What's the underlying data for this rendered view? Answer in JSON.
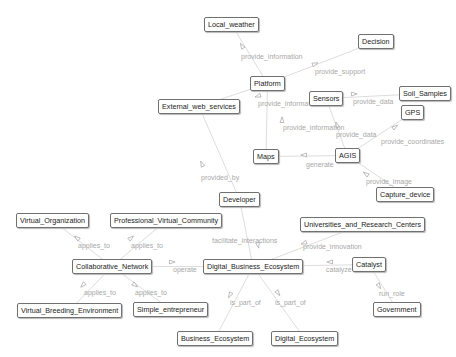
{
  "diagram": {
    "nodes": [
      {
        "id": "local_weather",
        "label": "Local_weather",
        "x": 204,
        "y": 17
      },
      {
        "id": "decision",
        "label": "Decision",
        "x": 358,
        "y": 34
      },
      {
        "id": "platform",
        "label": "Platform",
        "x": 250,
        "y": 76
      },
      {
        "id": "external_web_services",
        "label": "External_web_services",
        "x": 158,
        "y": 99
      },
      {
        "id": "sensors",
        "label": "Sensors",
        "x": 309,
        "y": 91
      },
      {
        "id": "soil_samples",
        "label": "Soil_Samples",
        "x": 399,
        "y": 86
      },
      {
        "id": "gps",
        "label": "GPS",
        "x": 401,
        "y": 105
      },
      {
        "id": "maps",
        "label": "Maps",
        "x": 253,
        "y": 149
      },
      {
        "id": "agis",
        "label": "AGIS",
        "x": 335,
        "y": 148
      },
      {
        "id": "developer",
        "label": "Developer",
        "x": 219,
        "y": 192
      },
      {
        "id": "capture_device",
        "label": "Capture_device",
        "x": 376,
        "y": 187
      },
      {
        "id": "virtual_organization",
        "label": "Virtual_Organization",
        "x": 16,
        "y": 213
      },
      {
        "id": "professional_virtual_community",
        "label": "Professional_Virtual_Community",
        "x": 110,
        "y": 213
      },
      {
        "id": "universities_and_research_centers",
        "label": "Universities_and_Research_Centers",
        "x": 300,
        "y": 217
      },
      {
        "id": "collaborative_network",
        "label": "Collaborative_Network",
        "x": 72,
        "y": 259
      },
      {
        "id": "digital_business_ecosystem",
        "label": "Digital_Business_Ecosystem",
        "x": 203,
        "y": 259
      },
      {
        "id": "catalyst",
        "label": "Catalyst",
        "x": 352,
        "y": 257
      },
      {
        "id": "virtual_breeding_environment",
        "label": "Virtual_Breeding_Environment",
        "x": 17,
        "y": 303
      },
      {
        "id": "simple_entrepreneur",
        "label": "Simple_entrepreneur",
        "x": 133,
        "y": 302
      },
      {
        "id": "government",
        "label": "Government",
        "x": 373,
        "y": 302
      },
      {
        "id": "business_ecosystem",
        "label": "Business_Ecosystem",
        "x": 177,
        "y": 331
      },
      {
        "id": "digital_ecosystem",
        "label": "Digital_Ecosystem",
        "x": 271,
        "y": 331
      }
    ],
    "edges": [
      {
        "from": "platform",
        "to": "local_weather",
        "label": "provide_information",
        "lx": 241,
        "ly": 53,
        "ax": 242,
        "ay": 46
      },
      {
        "from": "platform",
        "to": "decision",
        "label": "provide_support",
        "lx": 315,
        "ly": 68,
        "ax": 315,
        "ay": 64
      },
      {
        "from": "platform",
        "to": "external_web_services",
        "label": "provide_information",
        "lx": 258,
        "ly": 100,
        "ax": 258,
        "ay": 96
      },
      {
        "from": "sensors",
        "to": "soil_samples",
        "label": "provide_data",
        "lx": 353,
        "ly": 98,
        "ax": 354,
        "ay": 94
      },
      {
        "from": "maps",
        "to": "platform",
        "label": "provide_information",
        "lx": 283,
        "ly": 124,
        "ax": 282,
        "ay": 120
      },
      {
        "from": "agis",
        "to": "sensors",
        "label": "provide_data",
        "lx": 336,
        "ly": 131,
        "ax": 337,
        "ay": 125
      },
      {
        "from": "agis",
        "to": "gps",
        "label": "provide_coordinates",
        "lx": 381,
        "ly": 138,
        "ax": 395,
        "ay": 127
      },
      {
        "from": "agis",
        "to": "maps",
        "label": "generate",
        "lx": 306,
        "ly": 161,
        "ax": 304,
        "ay": 155
      },
      {
        "from": "capture_device",
        "to": "agis",
        "label": "provide_image",
        "lx": 366,
        "ly": 178,
        "ax": 366,
        "ay": 174
      },
      {
        "from": "developer",
        "to": "external_web_services",
        "label": "provided_by",
        "lx": 201,
        "ly": 174,
        "ax": 202,
        "ay": 164
      },
      {
        "from": "developer",
        "to": "digital_business_ecosystem",
        "label": "facilitate_interactions",
        "lx": 212,
        "ly": 237,
        "ax": 258,
        "ay": 245
      },
      {
        "from": "universities_and_research_centers",
        "to": "digital_business_ecosystem",
        "label": "provide_innovation",
        "lx": 303,
        "ly": 243,
        "ax": 304,
        "ay": 243
      },
      {
        "from": "collaborative_network",
        "to": "virtual_organization",
        "label": "applies_to",
        "lx": 78,
        "ly": 242,
        "ax": 77,
        "ay": 238
      },
      {
        "from": "collaborative_network",
        "to": "professional_virtual_community",
        "label": "applies_to",
        "lx": 131,
        "ly": 242,
        "ax": 131,
        "ay": 238
      },
      {
        "from": "collaborative_network",
        "to": "digital_business_ecosystem",
        "label": "operate",
        "lx": 173,
        "ly": 266,
        "ax": 172,
        "ay": 262
      },
      {
        "from": "catalyst",
        "to": "digital_business_ecosystem",
        "label": "catalyze",
        "lx": 326,
        "ly": 266,
        "ax": 330,
        "ay": 262
      },
      {
        "from": "catalyst",
        "to": "government",
        "label": "run_role",
        "lx": 379,
        "ly": 290,
        "ax": 379,
        "ay": 286
      },
      {
        "from": "collaborative_network",
        "to": "virtual_breeding_environment",
        "label": "applies_to",
        "lx": 84,
        "ly": 289,
        "ax": 83,
        "ay": 285
      },
      {
        "from": "collaborative_network",
        "to": "simple_entrepreneur",
        "label": "applies_to",
        "lx": 135,
        "ly": 289,
        "ax": 135,
        "ay": 285
      },
      {
        "from": "digital_business_ecosystem",
        "to": "business_ecosystem",
        "label": "is_part_of",
        "lx": 230,
        "ly": 299,
        "ax": 230,
        "ay": 295
      },
      {
        "from": "digital_business_ecosystem",
        "to": "digital_ecosystem",
        "label": "is_part_of",
        "lx": 275,
        "ly": 299,
        "ax": 278,
        "ay": 293
      }
    ]
  },
  "colors": {
    "edge": "#d4d4d4",
    "edge_label": "#a8a8a8",
    "node_border": "#707070",
    "node_text": "#222222",
    "background": "#ffffff"
  }
}
